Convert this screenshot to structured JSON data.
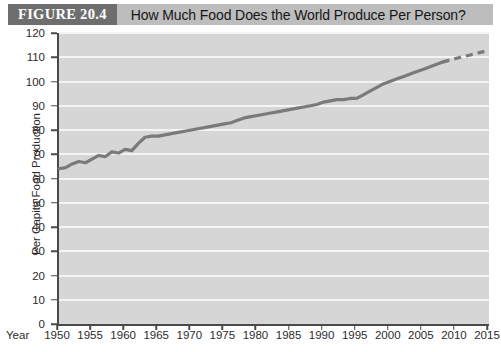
{
  "figure": {
    "number_label": "FIGURE 20.4",
    "title": "How Much Food Does the World Produce Per Person?"
  },
  "colors": {
    "number_band": "#6e6e6e",
    "title_band": "#bdbdbd",
    "plot_background": "#d6d6d6",
    "gridline": "#f4f4f4",
    "axis": "#4a4a4a",
    "data_line": "#7a7a7a"
  },
  "chart_data": {
    "type": "line",
    "title": "How Much Food Does the World Produce Per Person?",
    "xlabel": "Year",
    "ylabel": "Per Capita Food Production",
    "xlim": [
      1950,
      2015
    ],
    "ylim": [
      0,
      120
    ],
    "grid": true,
    "legend_position": "none",
    "y_ticks": [
      0,
      10,
      20,
      30,
      40,
      50,
      60,
      70,
      80,
      90,
      100,
      110,
      120
    ],
    "x_ticks": [
      1950,
      1955,
      1960,
      1965,
      1970,
      1975,
      1980,
      1985,
      1990,
      1995,
      2000,
      2005,
      2010,
      2015
    ],
    "series": [
      {
        "name": "Per capita food production (observed)",
        "style": "solid",
        "x": [
          1950,
          1951,
          1952,
          1953,
          1954,
          1955,
          1956,
          1957,
          1958,
          1959,
          1960,
          1961,
          1962,
          1963,
          1964,
          1965,
          1966,
          1967,
          1968,
          1969,
          1970,
          1971,
          1972,
          1973,
          1974,
          1975,
          1976,
          1977,
          1978,
          1979,
          1980,
          1981,
          1982,
          1983,
          1984,
          1985,
          1986,
          1987,
          1988,
          1989,
          1990,
          1991,
          1992,
          1993,
          1994,
          1995,
          1996,
          1997,
          1998,
          1999,
          2000,
          2001,
          2002,
          2003,
          2004,
          2005,
          2006,
          2007,
          2008
        ],
        "y": [
          64,
          64.5,
          66,
          67,
          66.5,
          68,
          69.5,
          69,
          71,
          70.5,
          72,
          71.5,
          74.5,
          77,
          77.5,
          77.5,
          78,
          78.5,
          79,
          79.5,
          80,
          80.5,
          81,
          81.5,
          82,
          82.5,
          83,
          84,
          85,
          85.5,
          86,
          86.5,
          87,
          87.5,
          88,
          88.5,
          89,
          89.5,
          90,
          90.5,
          91.5,
          92,
          92.5,
          92.5,
          93,
          93,
          94.5,
          96,
          97.5,
          99,
          100,
          101,
          102,
          103,
          104,
          105,
          106,
          107,
          108
        ]
      },
      {
        "name": "Projection",
        "style": "dashed",
        "x": [
          2008,
          2009,
          2010,
          2011,
          2012,
          2013,
          2014,
          2015
        ],
        "y": [
          108,
          108.8,
          109.5,
          110.2,
          110.8,
          111.5,
          112.2,
          113
        ]
      }
    ]
  }
}
